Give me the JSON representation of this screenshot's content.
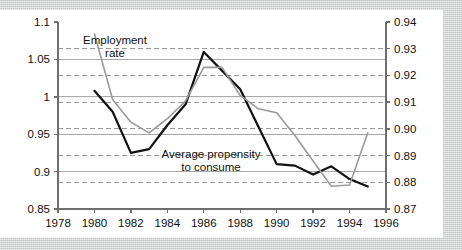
{
  "figure": {
    "background_color": "#c9cacb",
    "card_color": "#ffffff"
  },
  "chart_data": {
    "type": "line",
    "title": "",
    "xlabel": "",
    "ylabel": "",
    "grid": true,
    "legend_position": "inline-annotation",
    "x": [
      1980,
      1981,
      1982,
      1983,
      1984,
      1985,
      1986,
      1987,
      1988,
      1989,
      1990,
      1991,
      1992,
      1993,
      1994,
      1995
    ],
    "xlim": [
      1978,
      1996
    ],
    "xticks": [
      1978,
      1980,
      1982,
      1984,
      1986,
      1988,
      1990,
      1992,
      1994,
      1996
    ],
    "xticklabels": [
      "1978",
      "1980",
      "1982",
      "1984",
      "1986",
      "1988",
      "1990",
      "1992",
      "1994",
      "1996"
    ],
    "left_axis": {
      "ylim": [
        0.85,
        1.1
      ],
      "yticks": [
        0.85,
        0.9,
        0.95,
        1.0,
        1.05,
        1.1
      ],
      "yticklabels": [
        "0.85",
        "0.9",
        "0.95",
        "1",
        "1.05",
        "1.1"
      ],
      "gridline_style": "solid",
      "gridline_color": "#a8a8a8"
    },
    "right_axis": {
      "ylim": [
        0.87,
        0.94
      ],
      "yticks": [
        0.87,
        0.88,
        0.89,
        0.9,
        0.91,
        0.92,
        0.93,
        0.94
      ],
      "yticklabels": [
        "0.87",
        "0.88",
        "0.89",
        "0.90",
        "0.91",
        "0.92",
        "0.93",
        "0.94"
      ],
      "gridline_style": "dashed",
      "gridline_color": "#9a9a9a"
    },
    "series": [
      {
        "name": "Average propensity to consume",
        "axis": "left",
        "color": "#111111",
        "line_width": 2.2,
        "values": [
          1.008,
          0.98,
          0.925,
          0.93,
          0.962,
          0.99,
          1.06,
          1.035,
          1.01,
          0.96,
          0.91,
          0.908,
          0.896,
          0.907,
          0.89,
          0.88
        ]
      },
      {
        "name": "Employment rate",
        "axis": "right",
        "color": "#9a9a9a",
        "line_width": 1.6,
        "values": [
          0.9355,
          0.911,
          0.9025,
          0.8985,
          0.9038,
          0.9105,
          0.923,
          0.923,
          0.9125,
          0.9075,
          0.906,
          0.8975,
          0.888,
          0.8785,
          0.879,
          0.8985
        ]
      }
    ],
    "annotations": [
      {
        "name": "employment-rate-label",
        "lines": [
          "Employment",
          "rate"
        ],
        "x_px": 115,
        "y_px": 34,
        "align": "middle"
      },
      {
        "name": "average-propensity-label",
        "lines": [
          "Average propensity",
          "to consume"
        ],
        "x_px": 211,
        "y_px": 148,
        "align": "middle"
      }
    ]
  }
}
